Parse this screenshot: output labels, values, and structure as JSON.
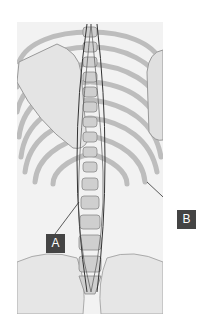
{
  "diagram": {
    "labels": [
      {
        "id": "A",
        "text": "A"
      },
      {
        "id": "B",
        "text": "B"
      }
    ],
    "colors": {
      "label_box": "#444444",
      "label_text": "#ffffff",
      "bone": "#d9d9d9",
      "outline": "#333333"
    }
  }
}
